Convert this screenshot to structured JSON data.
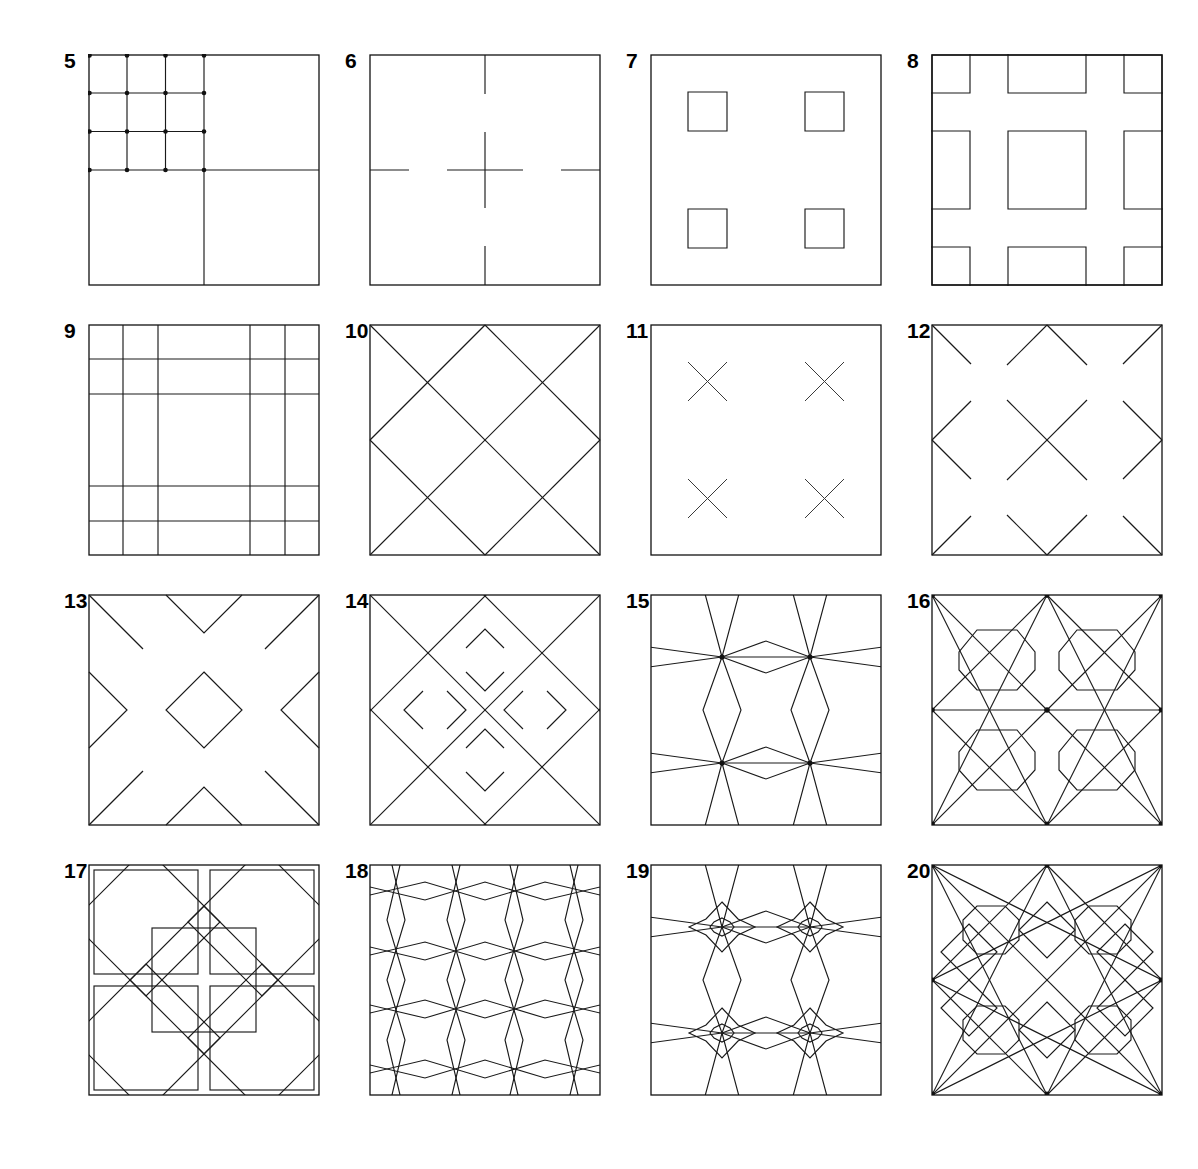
{
  "page": {
    "background_color": "#ffffff",
    "ink_color": "#1a1a1a",
    "columns": 4,
    "rows": 4
  },
  "figures": [
    {
      "number": "5",
      "name": "quartered-square-with-subdivided-grid",
      "description": "Square halved horizontally and vertically; upper-left quadrant subdivided into a 3 by 3 grid with dots at every intersection."
    },
    {
      "number": "6",
      "name": "broken-cross-axes",
      "description": "Square with interrupted centre cross; short dashes on the mid-axes at the frame edges."
    },
    {
      "number": "7",
      "name": "four-small-squares",
      "description": "Square frame containing four small outline squares in a 2 by 2 arrangement."
    },
    {
      "number": "8",
      "name": "nine-panel-block-grid",
      "description": "Square with nine rectangular blocks whose outer edges are clipped by the frame."
    },
    {
      "number": "9",
      "name": "five-by-five-uneven-grid",
      "description": "Square ruled into a 5 by 5 grid with narrow bands at the borders and a wide central band."
    },
    {
      "number": "10",
      "name": "diagonal-diamond-lattice",
      "description": "Square crossed by full diagonals through the corners and edge midpoints forming a diamond lattice."
    },
    {
      "number": "11",
      "name": "four-crosses",
      "description": "Square frame containing four small saltire crosses in a 2 by 2 arrangement."
    },
    {
      "number": "12",
      "name": "broken-diagonal-lattice",
      "description": "Diamond lattice of figure 10 with the diagonals broken into separate segments."
    },
    {
      "number": "13",
      "name": "central-diamond-with-edge-chevrons",
      "description": "Central diamond with half diamonds entering from each edge and diagonals at the corners."
    },
    {
      "number": "14",
      "name": "diamond-lattice-with-small-diamonds",
      "description": "Dense diagonal lattice with four small diamonds placed around the central field."
    },
    {
      "number": "15",
      "name": "four-node-lens-pattern",
      "description": "Four crossing nodes joined by long shallow lozenges and tall pointed lenses."
    },
    {
      "number": "16",
      "name": "four-octagons-on-diagonal-net",
      "description": "Diagonal net of triangles with an octagon set in the centre of each quadrant."
    },
    {
      "number": "17",
      "name": "octagon-star-tessellation",
      "description": "Interlacing tessellation of large octagons and eight pointed stars."
    },
    {
      "number": "18",
      "name": "six-point-star-net",
      "description": "Dense net of six pointed stars and hexagons filling the square."
    },
    {
      "number": "19",
      "name": "four-eight-point-stars",
      "description": "Four eight pointed stars with small octagon centres linked by lozenges."
    },
    {
      "number": "20",
      "name": "octagons-and-diamonds-lattice",
      "description": "Dense diagonal lattice with octagons in the quadrant centres and diamonds at the edge midpoints."
    }
  ]
}
